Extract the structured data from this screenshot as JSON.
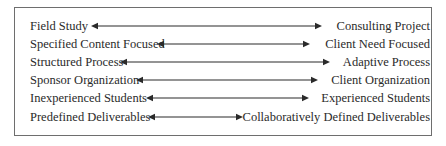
{
  "diagram": {
    "type": "spectrum-continuum",
    "rows": [
      {
        "left": "Field Study",
        "right": "Consulting Project",
        "arrow_x1": 91,
        "arrow_x2": 322
      },
      {
        "left": "Specified Content Focused",
        "right": "Client Need Focused",
        "arrow_x1": 157,
        "arrow_x2": 310
      },
      {
        "left": "Structured Process",
        "right": "Adaptive Process",
        "arrow_x1": 120,
        "arrow_x2": 330
      },
      {
        "left": "Sponsor Organization",
        "right": "Client Organization",
        "arrow_x1": 136,
        "arrow_x2": 318
      },
      {
        "left": "Inexperienced Students",
        "right": "Experienced Students",
        "arrow_x1": 146,
        "arrow_x2": 309
      },
      {
        "left": "Predefined Deliverables",
        "right": "Collaboratively Defined Deliverables",
        "arrow_x1": 148,
        "arrow_x2": 243
      }
    ],
    "colors": {
      "text": "#2a2a2a",
      "arrow": "#2a2a2a",
      "border": "#6e6e6e"
    }
  }
}
